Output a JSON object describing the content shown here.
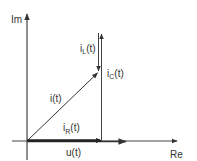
{
  "diagram": {
    "type": "phasor-diagram",
    "axes": {
      "imaginary_label": "Im",
      "real_label": "Re"
    },
    "phasors": [
      {
        "id": "u",
        "label": "u(t)",
        "label_base": "u",
        "label_sub": "",
        "label_tail": "(t)",
        "direction": "along Re axis"
      },
      {
        "id": "iR",
        "label": "i_R(t)",
        "label_base": "i",
        "label_sub": "R",
        "label_tail": "(t)",
        "direction": "along Re axis"
      },
      {
        "id": "iC",
        "label": "i_C(t)",
        "label_base": "i",
        "label_sub": "C",
        "label_tail": "(t)",
        "direction": "+Im (up)"
      },
      {
        "id": "iL",
        "label": "i_L(t)",
        "label_base": "i",
        "label_sub": "L",
        "label_tail": "(t)",
        "direction": "-Im (down)"
      },
      {
        "id": "i",
        "label": "i(t)",
        "label_base": "i",
        "label_sub": "",
        "label_tail": "(t)",
        "direction": "resultant, diagonal"
      }
    ],
    "colors": {
      "line": "#333333",
      "background": "#ffffff"
    }
  }
}
